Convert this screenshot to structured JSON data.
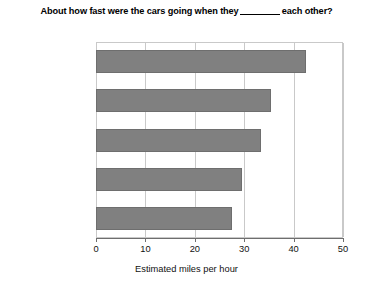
{
  "chart_data": {
    "type": "bar",
    "orientation": "horizontal",
    "title_prefix": "About how fast were the cars going when they",
    "title_blank": "______",
    "title_suffix": "each other?",
    "categories": [
      "“Smashed into”",
      "“Collided with”",
      "“Bumped into”",
      "“Hit”",
      "“Contacted”"
    ],
    "values": [
      42.5,
      35.5,
      33.5,
      29.5,
      27.5
    ],
    "xlabel": "Estimated miles per hour",
    "ylabel": "",
    "xlim": [
      0,
      50
    ],
    "xticks": [
      0,
      10,
      20,
      30,
      40,
      50
    ],
    "xtick_labels": [
      "0",
      "10",
      "20",
      "30",
      "40",
      "50"
    ],
    "grid": true,
    "grid_axis": "x",
    "legend": false,
    "bar_color": "#808080",
    "bar_edge_color": "#6e6e6e",
    "grid_color": "#c9c9c9",
    "background": "#ffffff"
  }
}
